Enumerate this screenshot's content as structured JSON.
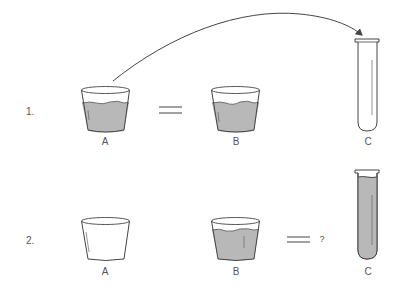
{
  "colors": {
    "background": "#ffffff",
    "outline": "#444444",
    "liquid": "#b8b8b8",
    "text": "#555555"
  },
  "rows": [
    {
      "number": "1.",
      "containers": [
        {
          "label": "A",
          "type": "beaker",
          "filled": true
        },
        {
          "label": "B",
          "type": "beaker",
          "filled": true
        },
        {
          "label": "C",
          "type": "test-tube",
          "filled": false
        }
      ],
      "relation": "=",
      "relation_between": [
        "A",
        "B"
      ],
      "arrow": {
        "from": "A",
        "to": "C"
      }
    },
    {
      "number": "2.",
      "containers": [
        {
          "label": "A",
          "type": "beaker",
          "filled": false
        },
        {
          "label": "B",
          "type": "beaker",
          "filled": true
        },
        {
          "label": "C",
          "type": "test-tube",
          "filled": true
        }
      ],
      "relation": "=",
      "relation_between": [
        "B",
        "C"
      ],
      "question_mark": "?"
    }
  ]
}
